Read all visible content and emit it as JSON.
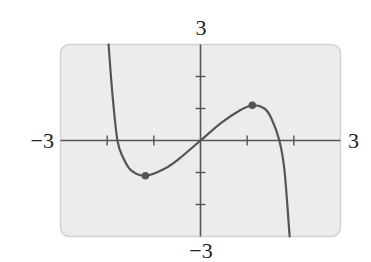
{
  "chart_data": {
    "type": "line",
    "title": "",
    "xlabel": "",
    "ylabel": "",
    "xlim": [
      -3,
      3
    ],
    "ylim": [
      -3,
      3
    ],
    "x_tick_step": 1,
    "y_tick_step": 1,
    "grid": false,
    "legend": null,
    "window_labels": {
      "xmin": "−3",
      "xmax": "3",
      "ymin": "−3",
      "ymax": "3"
    },
    "series": [
      {
        "name": "f(x)",
        "points": [
          [
            -1.97,
            3.0
          ],
          [
            -1.89,
            1.5
          ],
          [
            -1.78,
            0.0
          ],
          [
            -1.65,
            -0.56
          ],
          [
            -1.48,
            -0.94
          ],
          [
            -1.18,
            -1.1
          ],
          [
            -0.77,
            -0.88
          ],
          [
            -0.45,
            -0.56
          ],
          [
            0.0,
            0.0
          ],
          [
            0.45,
            0.56
          ],
          [
            0.84,
            0.94
          ],
          [
            1.11,
            1.1
          ],
          [
            1.37,
            1.0
          ],
          [
            1.52,
            0.69
          ],
          [
            1.69,
            0.0
          ],
          [
            1.8,
            -0.94
          ],
          [
            1.91,
            -3.0
          ]
        ]
      }
    ],
    "marked_points": [
      {
        "label": "relative minimum",
        "x": -1.18,
        "y": -1.1
      },
      {
        "label": "relative maximum",
        "x": 1.11,
        "y": 1.1
      }
    ]
  },
  "colors": {
    "window_fill": "#ececec",
    "window_border": "#d2d2d2",
    "axis": "#555555",
    "curve": "#555555",
    "marker": "#555555"
  }
}
